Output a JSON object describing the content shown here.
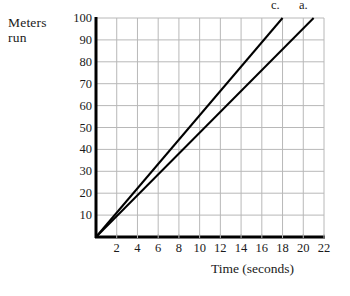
{
  "chart_data": {
    "type": "line",
    "title": "",
    "xlabel": "Time (seconds)",
    "ylabel": "Meters run",
    "ylabel_line1": "Meters",
    "ylabel_line2": "run",
    "xlim": [
      0,
      22
    ],
    "ylim": [
      0,
      100
    ],
    "grid": true,
    "legend_position": "above-line-ends",
    "xticks": [
      2,
      4,
      6,
      8,
      10,
      12,
      14,
      16,
      18,
      20,
      22
    ],
    "yticks": [
      10,
      20,
      30,
      40,
      50,
      60,
      70,
      80,
      90,
      100
    ],
    "xtick_labels": [
      "2",
      "4",
      "6",
      "8",
      "10",
      "12",
      "14",
      "16",
      "18",
      "20",
      "22"
    ],
    "ytick_labels": [
      "10",
      "20",
      "30",
      "40",
      "50",
      "60",
      "70",
      "80",
      "90",
      "100"
    ],
    "series": [
      {
        "name": "c.",
        "label": "c.",
        "color": "#000000",
        "points": [
          [
            0,
            0
          ],
          [
            18,
            100
          ]
        ],
        "slope_m_per_s": 5.56
      },
      {
        "name": "a.",
        "label": "a.",
        "color": "#000000",
        "points": [
          [
            0,
            0
          ],
          [
            21,
            100
          ]
        ],
        "slope_m_per_s": 4.76
      }
    ],
    "annotations": [
      {
        "text": "c.",
        "x": 17.3,
        "y": 106
      },
      {
        "text": "a.",
        "x": 20.0,
        "y": 106
      }
    ]
  },
  "style": {
    "axis_color": "#000000",
    "grid_color": "#b8b8b8",
    "line_color": "#000000",
    "background": "#ffffff"
  }
}
